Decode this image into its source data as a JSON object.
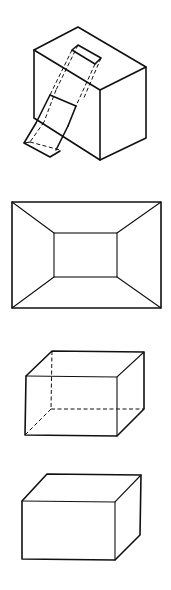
{
  "figures": [
    {
      "id": "figure-1",
      "description": "Isometric cube pierced by an inclined rectangular prism (hidden edges dashed)"
    },
    {
      "id": "figure-2",
      "description": "Rectangle with inner rectangle and corner-connecting diagonals (frustum / room view)"
    },
    {
      "id": "figure-3",
      "description": "Oblique rectangular box with hidden edges shown dashed"
    },
    {
      "id": "figure-4",
      "description": "Oblique rectangular box, solid view"
    }
  ],
  "colors": {
    "line": "#111111",
    "background": "#ffffff"
  }
}
